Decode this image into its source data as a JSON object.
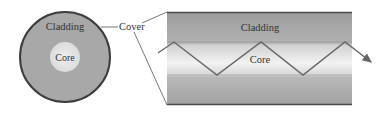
{
  "diagram": {
    "cross_section": {
      "cladding_label": "Cladding",
      "core_label": "Core"
    },
    "cover_label": "Cover",
    "longitudinal": {
      "cladding_label": "Cladding",
      "core_label": "Core"
    }
  },
  "colors": {
    "cladding": "#a9a9a9",
    "core": "#e6e6e6",
    "cover_edge": "#4a4a4a",
    "ray": "#666666"
  }
}
